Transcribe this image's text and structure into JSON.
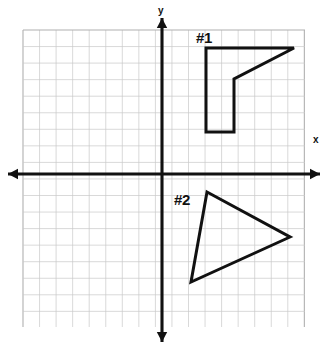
{
  "figure": {
    "background_color": "#ffffff",
    "ink_color": "#111111",
    "grid_color": "#c9c9c9",
    "grid_border_color": "#b0b0b0"
  },
  "chart_data": {
    "type": "scatter",
    "title": "",
    "xlabel": "x",
    "ylabel": "y",
    "grid": true,
    "legend_position": "none",
    "axis_style": "double-arrow-cartesian",
    "origin_px": {
      "x": 162,
      "y": 174
    },
    "grid_spacing_px": 16.55,
    "grid_extent_px": {
      "left": 23,
      "right": 305,
      "top": 30,
      "bottom": 327
    },
    "grid_columns": 17,
    "grid_rows": 18,
    "xlim": [
      -8.4,
      8.6
    ],
    "ylim": [
      -9.3,
      8.7
    ],
    "x_axis_endpoints_px": [
      {
        "x": 8,
        "y": 174
      },
      {
        "x": 320,
        "y": 174
      }
    ],
    "y_axis_endpoints_px": [
      {
        "x": 162,
        "y": 18
      },
      {
        "x": 162,
        "y": 342
      }
    ],
    "annotations": [
      {
        "text": "x",
        "x_px": 313,
        "y_px": 143,
        "name": "x-axis-label"
      },
      {
        "text": "y",
        "x_px": 158,
        "y_px": 14,
        "name": "y-axis-label"
      },
      {
        "text": "#1",
        "x_px": 196,
        "y_px": 43,
        "name": "figure-1-label"
      },
      {
        "text": "#2",
        "x_px": 174,
        "y_px": 205,
        "name": "figure-2-label"
      }
    ],
    "series": [
      {
        "name": "#1",
        "shape": "pentagon",
        "label": "#1",
        "closed": true,
        "points_px": [
          {
            "x": 206,
            "y": 48
          },
          {
            "x": 294,
            "y": 48
          },
          {
            "x": 234,
            "y": 79
          },
          {
            "x": 234,
            "y": 132
          },
          {
            "x": 206,
            "y": 132
          }
        ],
        "points_grid": [
          {
            "x": 2.7,
            "y": 7.6
          },
          {
            "x": 8.0,
            "y": 7.6
          },
          {
            "x": 4.4,
            "y": 5.7
          },
          {
            "x": 4.4,
            "y": 2.5
          },
          {
            "x": 2.7,
            "y": 2.5
          }
        ]
      },
      {
        "name": "#2",
        "shape": "triangle",
        "label": "#2",
        "closed": true,
        "points_px": [
          {
            "x": 207,
            "y": 192
          },
          {
            "x": 290,
            "y": 237
          },
          {
            "x": 191,
            "y": 282
          }
        ],
        "points_grid": [
          {
            "x": 2.7,
            "y": -1.1
          },
          {
            "x": 7.7,
            "y": -3.8
          },
          {
            "x": 1.8,
            "y": -6.5
          }
        ]
      }
    ]
  }
}
